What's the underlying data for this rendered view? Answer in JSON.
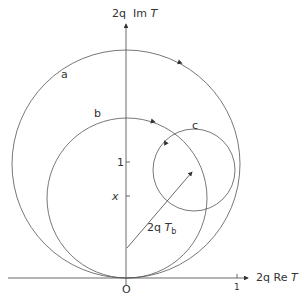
{
  "axes": {
    "y_label": {
      "prefix": "2q",
      "text": "Im",
      "var": "T"
    },
    "x_label": {
      "prefix": "2q",
      "text": "Re",
      "var": "T"
    },
    "origin_label": "O",
    "y_tick_1": "1",
    "y_tick_x": "x",
    "x_tick_1": "1"
  },
  "curves": [
    {
      "id": "a",
      "label": "a",
      "cx": 126,
      "cy": 163,
      "r": 114
    },
    {
      "id": "b",
      "label": "b",
      "cx": 127,
      "cy": 197,
      "r": 80
    },
    {
      "id": "c",
      "label": "c",
      "cx": 194,
      "cy": 170,
      "r": 41
    }
  ],
  "vector": {
    "label_prefix": "2q",
    "label_var": "T",
    "label_sub": "b"
  },
  "colors": {
    "line": "#555555",
    "text": "#333333",
    "background": "#ffffff"
  }
}
